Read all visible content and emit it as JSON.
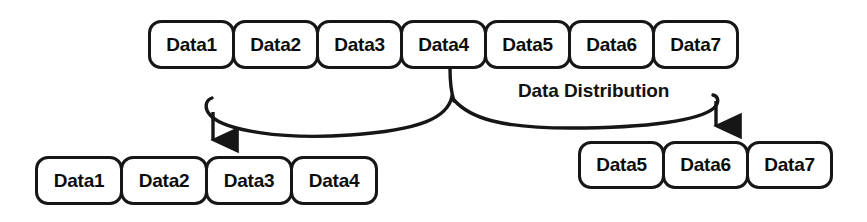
{
  "diagram": {
    "title": "Data Distribution",
    "caption": "Data Distribution",
    "source_row": {
      "name": "source-dataset",
      "boxes": [
        {
          "label": "Data1"
        },
        {
          "label": "Data2"
        },
        {
          "label": "Data3"
        },
        {
          "label": "Data4"
        },
        {
          "label": "Data5"
        },
        {
          "label": "Data6"
        },
        {
          "label": "Data7"
        }
      ]
    },
    "partition_left": {
      "name": "partition-left",
      "boxes": [
        {
          "label": "Data1"
        },
        {
          "label": "Data2"
        },
        {
          "label": "Data3"
        },
        {
          "label": "Data4"
        }
      ]
    },
    "partition_right": {
      "name": "partition-right",
      "boxes": [
        {
          "label": "Data5"
        },
        {
          "label": "Data6"
        },
        {
          "label": "Data7"
        }
      ]
    },
    "arrows": [
      {
        "name": "arrow-to-left-partition",
        "from": "source-row-split-point",
        "to": "partition-left"
      },
      {
        "name": "arrow-to-right-partition",
        "from": "source-row-split-point",
        "to": "partition-right"
      }
    ],
    "colors": {
      "background": "#ffffff",
      "stroke": "#161616",
      "text": "#0d0d0d"
    }
  }
}
